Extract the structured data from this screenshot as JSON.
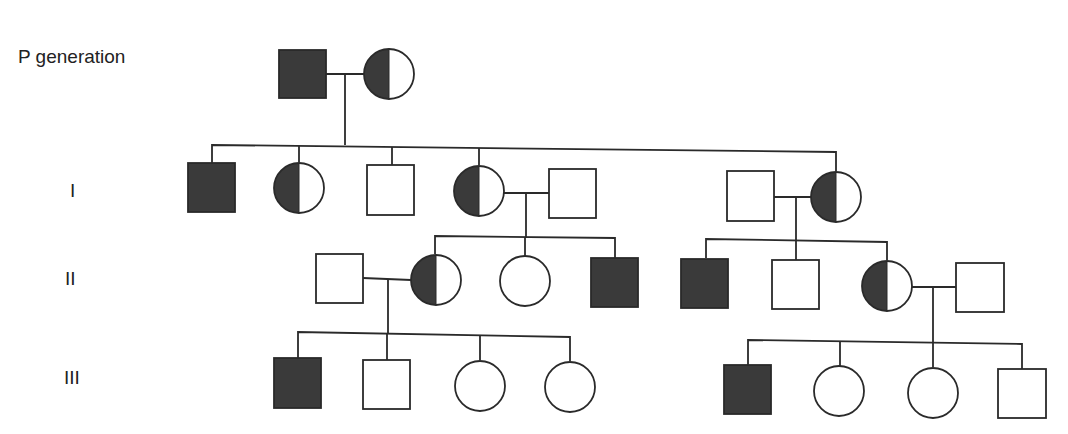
{
  "labels": {
    "p": "P generation",
    "g1": "I",
    "g2": "II",
    "g3": "III"
  },
  "colors": {
    "affected": "#3a3a3a",
    "unaffected": "#ffffff",
    "line": "#2a2a2a"
  },
  "legend_semantics": {
    "filled_square": "affected male",
    "empty_square": "unaffected male",
    "empty_circle": "unaffected female",
    "half_filled_circle": "carrier female"
  },
  "pedigree": {
    "P": [
      {
        "id": "P1",
        "sex": "male",
        "status": "affected"
      },
      {
        "id": "P2",
        "sex": "female",
        "status": "carrier"
      }
    ],
    "I": [
      {
        "id": "I1",
        "sex": "male",
        "status": "affected"
      },
      {
        "id": "I2",
        "sex": "female",
        "status": "carrier"
      },
      {
        "id": "I3",
        "sex": "male",
        "status": "unaffected"
      },
      {
        "id": "I4",
        "sex": "female",
        "status": "carrier",
        "spouse": "I5"
      },
      {
        "id": "I5",
        "sex": "male",
        "status": "unaffected",
        "married_in": true
      },
      {
        "id": "I6",
        "sex": "male",
        "status": "unaffected",
        "married_in": true
      },
      {
        "id": "I7",
        "sex": "female",
        "status": "carrier",
        "spouse": "I6"
      }
    ],
    "II": [
      {
        "id": "II1",
        "sex": "male",
        "status": "unaffected",
        "married_in": true
      },
      {
        "id": "II2",
        "sex": "female",
        "status": "carrier",
        "parents": "I4xI5",
        "spouse": "II1"
      },
      {
        "id": "II3",
        "sex": "female",
        "status": "unaffected",
        "parents": "I4xI5"
      },
      {
        "id": "II4",
        "sex": "male",
        "status": "affected",
        "parents": "I4xI5"
      },
      {
        "id": "II5",
        "sex": "male",
        "status": "affected",
        "parents": "I6xI7"
      },
      {
        "id": "II6",
        "sex": "male",
        "status": "unaffected",
        "parents": "I6xI7"
      },
      {
        "id": "II7",
        "sex": "female",
        "status": "carrier",
        "parents": "I6xI7",
        "spouse": "II8"
      },
      {
        "id": "II8",
        "sex": "male",
        "status": "unaffected",
        "married_in": true
      }
    ],
    "III": [
      {
        "id": "III1",
        "sex": "male",
        "status": "affected",
        "parents": "II1xII2"
      },
      {
        "id": "III2",
        "sex": "male",
        "status": "unaffected",
        "parents": "II1xII2"
      },
      {
        "id": "III3",
        "sex": "female",
        "status": "unaffected",
        "parents": "II1xII2"
      },
      {
        "id": "III4",
        "sex": "female",
        "status": "unaffected",
        "parents": "II1xII2"
      },
      {
        "id": "III5",
        "sex": "male",
        "status": "affected",
        "parents": "II7xII8"
      },
      {
        "id": "III6",
        "sex": "female",
        "status": "unaffected",
        "parents": "II7xII8"
      },
      {
        "id": "III7",
        "sex": "female",
        "status": "unaffected",
        "parents": "II7xII8"
      },
      {
        "id": "III8",
        "sex": "male",
        "status": "unaffected",
        "parents": "II7xII8"
      }
    ]
  }
}
